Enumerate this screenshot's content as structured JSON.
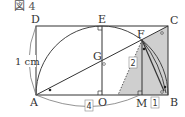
{
  "figure": {
    "title": "図 4",
    "unit_label": "1 cm"
  },
  "points": {
    "A": "A",
    "B": "B",
    "C": "C",
    "D": "D",
    "E": "E",
    "F": "F",
    "G": "G",
    "M": "M",
    "O": "O"
  },
  "boxed_labels": {
    "AB": "4",
    "FM": "2",
    "MB": "1"
  },
  "colors": {
    "line": "#333333",
    "arc": "#555555",
    "shade": "#c8c8c8",
    "label_box": "#888888"
  }
}
